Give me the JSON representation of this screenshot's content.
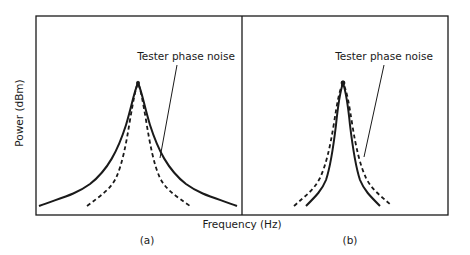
{
  "figure": {
    "y_axis_label": "Power (dBm)",
    "x_axis_label": "Frequency (Hz)",
    "panels": [
      {
        "id": "a",
        "caption": "(a)",
        "annotation": "Tester phase noise",
        "curves": [
          {
            "name": "tester-phase-noise",
            "style": "solid",
            "shape": "wide skirt"
          },
          {
            "name": "dut-signal",
            "style": "dashed",
            "shape": "narrower skirt"
          }
        ],
        "note": "Tester phase noise skirt is wider than the measured signal"
      },
      {
        "id": "b",
        "caption": "(b)",
        "annotation": "Tester phase noise",
        "curves": [
          {
            "name": "tester-phase-noise",
            "style": "solid",
            "shape": "narrow skirt"
          },
          {
            "name": "dut-signal",
            "style": "dashed",
            "shape": "slightly wider skirt"
          }
        ],
        "note": "Tester phase noise skirt is narrower than the measured signal"
      }
    ],
    "colors": {
      "line": "#1a1a1a",
      "background": "#ffffff"
    }
  }
}
